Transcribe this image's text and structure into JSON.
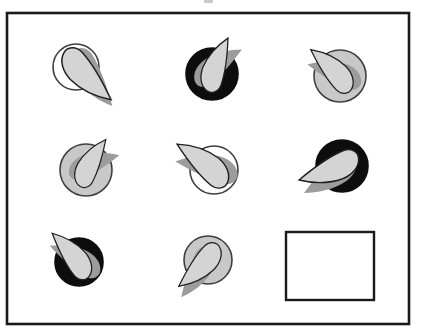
{
  "figure": {
    "type": "matrix-puzzle",
    "canvas": {
      "width": 421,
      "height": 334
    },
    "frame": {
      "x": 7,
      "y": 13,
      "width": 402,
      "height": 311,
      "stroke": "#1a1a1a",
      "stroke_width": 2.6
    },
    "artifact": {
      "x": 204,
      "y": 0,
      "width": 9,
      "height": 3,
      "color": "#b5b5b5"
    },
    "colors": {
      "background": "#ffffff",
      "leaf": "#d4d4d4",
      "leaf_outline": "#1f1f1f",
      "shadow": "#9c9c9c",
      "circle_white": "#ffffff",
      "circle_gray": "#c8c8c8",
      "circle_black": "#0d0d0d",
      "circle_outline": "#3f3f3f",
      "answer_box_stroke": "#1a1a1a"
    },
    "blade_path": "M 58 0 C 38 -8 18 -14 4 -15 C -4.5 -15.5 -10.5 -9 -8.5 -2 C -6.5 6 2 12 14 13 C 30 13.5 46 7.5 58 0 Z",
    "cells": [
      {
        "row": 1,
        "col": 1,
        "circle": "white",
        "cx": 76,
        "cy": 67,
        "r": 23,
        "leaf_angle": 43,
        "scale": 1.0,
        "flip": false,
        "shadow_delta": 10,
        "shadow_offset": [
          5,
          3
        ]
      },
      {
        "row": 1,
        "col": 2,
        "circle": "black",
        "cx": 212,
        "cy": 74,
        "r": 26,
        "leaf_angle": -66,
        "scale": 0.85,
        "flip": true,
        "shadow_delta": 34,
        "shadow_offset": [
          3,
          2
        ]
      },
      {
        "row": 1,
        "col": 3,
        "circle": "gray",
        "cx": 340,
        "cy": 76,
        "r": 26,
        "leaf_angle": -138,
        "scale": 0.85,
        "flip": false,
        "shadow_delta": -26,
        "shadow_offset": [
          2,
          5
        ]
      },
      {
        "row": 2,
        "col": 1,
        "circle": "gray",
        "cx": 86,
        "cy": 170,
        "r": 26,
        "leaf_angle": -57,
        "scale": 0.8,
        "flip": true,
        "shadow_delta": 40,
        "shadow_offset": [
          4,
          3
        ]
      },
      {
        "row": 2,
        "col": 2,
        "circle": "white",
        "cx": 214,
        "cy": 170,
        "r": 24,
        "leaf_angle": -145,
        "scale": 0.95,
        "flip": false,
        "shadow_delta": -26,
        "shadow_offset": [
          3,
          6
        ]
      },
      {
        "row": 2,
        "col": 3,
        "circle": "black",
        "cx": 342,
        "cy": 166,
        "r": 26,
        "leaf_angle": 162,
        "scale": 0.95,
        "flip": true,
        "shadow_delta": -14,
        "shadow_offset": [
          2,
          7
        ]
      },
      {
        "row": 3,
        "col": 1,
        "circle": "black",
        "cx": 79,
        "cy": 262,
        "r": 24,
        "leaf_angle": -133,
        "scale": 0.85,
        "flip": false,
        "shadow_delta": -22,
        "shadow_offset": [
          3,
          5
        ]
      },
      {
        "row": 3,
        "col": 2,
        "circle": "gray",
        "cx": 208,
        "cy": 260,
        "r": 24,
        "leaf_angle": 138,
        "scale": 0.85,
        "flip": true,
        "shadow_delta": -14,
        "shadow_offset": [
          -2,
          7
        ]
      },
      {
        "row": 3,
        "col": 3,
        "type": "answer_box",
        "x": 286,
        "y": 232,
        "width": 88,
        "height": 68
      }
    ]
  }
}
